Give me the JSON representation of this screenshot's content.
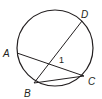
{
  "diagram": {
    "type": "circle-chords",
    "circle": {
      "cx": 55,
      "cy": 48,
      "r": 38
    },
    "points": {
      "A": {
        "label": "A",
        "x": 17,
        "y": 53,
        "lx": 3,
        "ly": 57
      },
      "B": {
        "label": "B",
        "x": 34,
        "y": 83,
        "lx": 24,
        "ly": 96
      },
      "C": {
        "label": "C",
        "x": 84,
        "y": 76,
        "lx": 88,
        "ly": 84
      },
      "D": {
        "label": "D",
        "x": 82,
        "y": 21,
        "lx": 81,
        "ly": 19
      }
    },
    "chords": [
      [
        "A",
        "C"
      ],
      [
        "B",
        "D"
      ],
      [
        "B",
        "C"
      ]
    ],
    "angle_label": {
      "text": "1",
      "x": 60,
      "y": 61
    },
    "stroke_color": "#231f20"
  }
}
